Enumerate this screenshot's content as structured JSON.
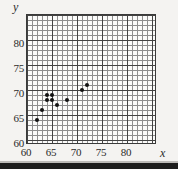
{
  "figure": {
    "kind": "scatter-plot",
    "background_color": "#f4f3f1",
    "plot_background_color": "#fbfbfa",
    "grid_minor_color": "#8e8e8e",
    "grid_major_color": "#434343",
    "point_color": "#111111",
    "frame_color": "#3a3a3a"
  },
  "axes": {
    "x_name": "x",
    "y_name": "y",
    "x_ticks": [
      "60",
      "65",
      "70",
      "75",
      "80"
    ],
    "y_ticks": [
      "60",
      "65",
      "70",
      "75",
      "80"
    ]
  },
  "chart_data": {
    "type": "scatter",
    "title": "",
    "xlabel": "x",
    "ylabel": "y",
    "xlim": [
      60,
      86
    ],
    "ylim": [
      60,
      86
    ],
    "x_ticks": [
      60,
      65,
      70,
      75,
      80
    ],
    "y_ticks": [
      60,
      65,
      70,
      75,
      80
    ],
    "x_minor_step": 1,
    "y_minor_step": 1,
    "grid": true,
    "legend": false,
    "points": [
      {
        "x": 62,
        "y": 65
      },
      {
        "x": 63,
        "y": 67
      },
      {
        "x": 64,
        "y": 69
      },
      {
        "x": 64,
        "y": 70
      },
      {
        "x": 65,
        "y": 69
      },
      {
        "x": 65,
        "y": 70
      },
      {
        "x": 66,
        "y": 68
      },
      {
        "x": 68,
        "y": 69
      },
      {
        "x": 71,
        "y": 71
      },
      {
        "x": 72,
        "y": 72
      }
    ]
  }
}
